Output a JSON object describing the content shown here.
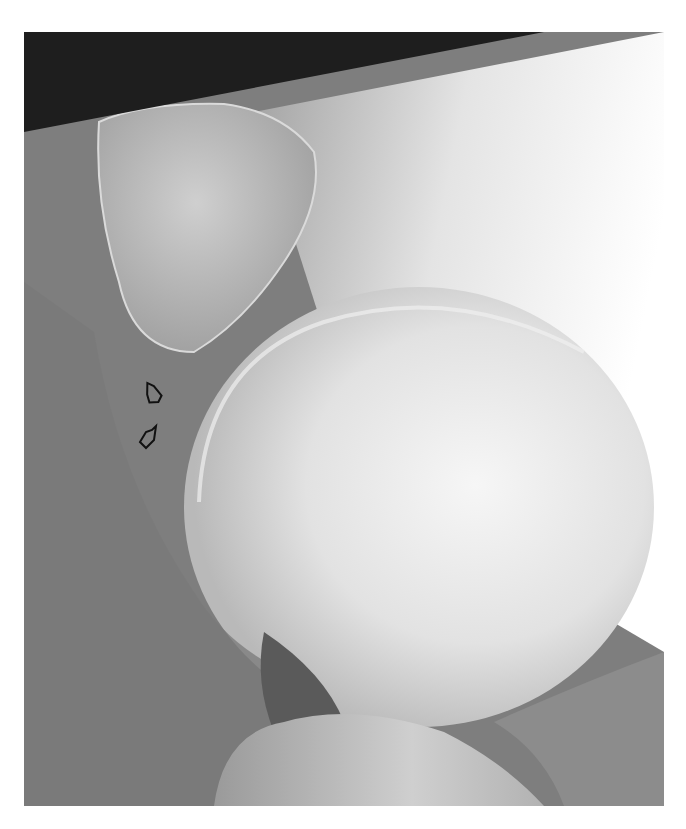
{
  "figure": {
    "type": "radiograph",
    "view": "lateral joint x-ray (grayscale)",
    "annotations": [
      {
        "kind": "open-arrow",
        "x": 145,
        "y": 395
      },
      {
        "kind": "open-arrow",
        "x": 140,
        "y": 440
      }
    ],
    "colors": {
      "background": "#ffffff",
      "dark_corner": "#1e1e1e",
      "soft_tissue": "#7d7d7d",
      "bone_light": "#efefef"
    }
  }
}
